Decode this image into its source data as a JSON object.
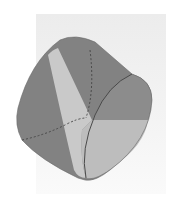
{
  "figure": {
    "type": "3d-solid-render",
    "colors": {
      "background": "#ffffff",
      "backdrop": "#eeeeee",
      "body_dark": "#7a7a7a",
      "body_mid": "#8e8e8e",
      "face_light": "#c4c4c4",
      "face_lighter": "#b5b5b5",
      "edge": "#4a4a4a"
    }
  }
}
